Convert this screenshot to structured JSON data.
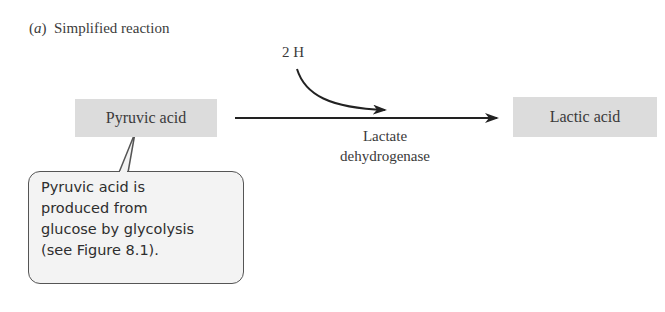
{
  "panel": {
    "label_letter": "a",
    "label_open": "(",
    "label_close": ")",
    "title": "Simplified reaction"
  },
  "reaction": {
    "substrate": "Pyruvic acid",
    "product": "Lactic acid",
    "cofactor": "2 H",
    "enzyme_line1": "Lactate",
    "enzyme_line2": "dehydrogenase"
  },
  "callout": {
    "lines": [
      "Pyruvic acid is",
      "produced from",
      "glucose by glycolysis",
      "(see Figure 8.1)."
    ]
  },
  "colors": {
    "box_fill": "#dcdcdc",
    "arrow": "#222222",
    "callout_fill": "#f3f3f3",
    "callout_border": "#555555"
  }
}
